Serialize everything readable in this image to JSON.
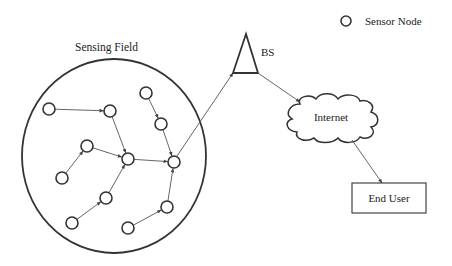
{
  "diagram": {
    "colors": {
      "stroke": "#333333",
      "edge": "#555555",
      "text": "#222222",
      "background": "#ffffff"
    },
    "legend": {
      "symbol": "circle",
      "label": "Sensor Node"
    },
    "sensing_field": {
      "label": "Sensing Field",
      "shape": "ellipse",
      "cx": 114,
      "cy": 156,
      "rx": 92,
      "ry": 97
    },
    "nodes": [
      {
        "id": "A",
        "x": 49,
        "y": 109
      },
      {
        "id": "B",
        "x": 110,
        "y": 111
      },
      {
        "id": "C",
        "x": 146,
        "y": 93
      },
      {
        "id": "D",
        "x": 161,
        "y": 124
      },
      {
        "id": "E",
        "x": 87,
        "y": 146
      },
      {
        "id": "F",
        "x": 128,
        "y": 159
      },
      {
        "id": "G",
        "x": 174,
        "y": 162
      },
      {
        "id": "H",
        "x": 62,
        "y": 178
      },
      {
        "id": "I",
        "x": 106,
        "y": 198
      },
      {
        "id": "J",
        "x": 72,
        "y": 223
      },
      {
        "id": "K",
        "x": 167,
        "y": 207
      },
      {
        "id": "L",
        "x": 128,
        "y": 228
      }
    ],
    "edges": [
      {
        "from": "A",
        "to": "B"
      },
      {
        "from": "B",
        "to": "F"
      },
      {
        "from": "H",
        "to": "E"
      },
      {
        "from": "E",
        "to": "F"
      },
      {
        "from": "J",
        "to": "I"
      },
      {
        "from": "I",
        "to": "F"
      },
      {
        "from": "F",
        "to": "G"
      },
      {
        "from": "C",
        "to": "D"
      },
      {
        "from": "D",
        "to": "G"
      },
      {
        "from": "L",
        "to": "K"
      },
      {
        "from": "K",
        "to": "G"
      },
      {
        "from": "G",
        "to": "BS"
      },
      {
        "from": "BS",
        "to": "Internet"
      },
      {
        "from": "Internet",
        "to": "End User"
      }
    ],
    "base_station": {
      "label": "BS",
      "shape": "triangle"
    },
    "internet": {
      "label": "Internet",
      "shape": "cloud"
    },
    "end_user": {
      "label": "End User",
      "shape": "rectangle"
    }
  }
}
